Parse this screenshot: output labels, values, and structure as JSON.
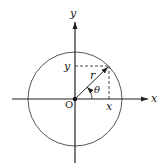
{
  "diagram": {
    "labels": {
      "x_axis": "x",
      "y_axis": "y",
      "origin": "O",
      "radius": "r",
      "angle": "θ",
      "x_projection": "x",
      "y_projection": "y"
    },
    "colors": {
      "stroke": "#222222",
      "background": "#ffffff"
    }
  }
}
